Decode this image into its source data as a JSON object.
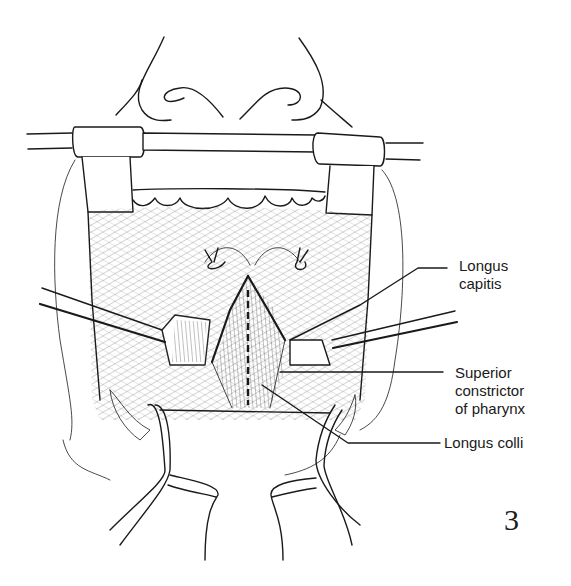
{
  "figure": {
    "number": "3",
    "labels": [
      {
        "id": "longus-capitis",
        "lines": [
          "Longus",
          "capitis"
        ]
      },
      {
        "id": "superior-constrictor",
        "lines": [
          "Superior",
          "constrictor",
          "of pharynx"
        ]
      },
      {
        "id": "longus-colli",
        "lines": [
          "Longus colli"
        ]
      }
    ]
  },
  "colors": {
    "ink": "#1a1a1a",
    "background": "#ffffff"
  }
}
